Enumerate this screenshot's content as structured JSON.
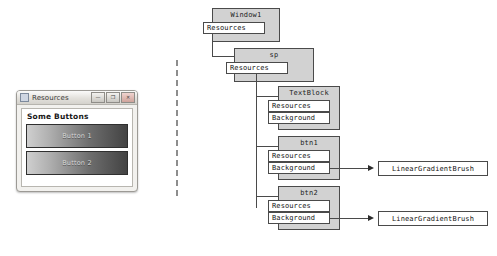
{
  "app_window": {
    "title": "Resources",
    "icon": "window-icon",
    "titlebar_buttons": [
      {
        "name": "minimize-button",
        "glyph": "—"
      },
      {
        "name": "maximize-button",
        "glyph": "❐"
      },
      {
        "name": "close-button",
        "glyph": "✕"
      }
    ],
    "panel_heading": "Some Buttons",
    "buttons": [
      {
        "label": "Button 1"
      },
      {
        "label": "Button 2"
      }
    ]
  },
  "divider": {
    "style": "dashed-vertical"
  },
  "diagram": {
    "nodes": [
      {
        "id": "window1",
        "title": "Window1",
        "properties": [
          "Resources"
        ],
        "brush_links": []
      },
      {
        "id": "sp",
        "title": "sp",
        "properties": [
          "Resources"
        ],
        "brush_links": []
      },
      {
        "id": "textblock",
        "title": "TextBlock",
        "properties": [
          "Resources",
          "Background"
        ],
        "brush_links": []
      },
      {
        "id": "btn1",
        "title": "btn1",
        "properties": [
          "Resources",
          "Background"
        ],
        "brush_links": [
          "LinearGradientBrush"
        ]
      },
      {
        "id": "btn2",
        "title": "btn2",
        "properties": [
          "Resources",
          "Background"
        ],
        "brush_links": [
          "LinearGradientBrush"
        ]
      }
    ],
    "brushes": [
      {
        "id": "brush1",
        "label": "LinearGradientBrush"
      },
      {
        "id": "brush2",
        "label": "LinearGradientBrush"
      }
    ]
  },
  "colors": {
    "node_fill": "#d2d2d2",
    "node_border": "#4a4a4a",
    "prop_fill": "#ffffff",
    "divider": "#8d8d8d",
    "button_gradient_start": "#cfcfcf",
    "button_gradient_end": "#434343"
  }
}
